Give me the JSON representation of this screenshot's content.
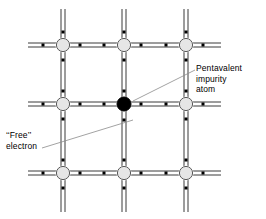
{
  "diagram": {
    "labels": {
      "pentavalent": "Pentavalent\nimpurity\natom",
      "free_electron": "‘‘Free’’\nelectron"
    },
    "colors": {
      "background": "#ffffff",
      "bond_line": "#3a3a3a",
      "atom_outline": "#4a4a4a",
      "atom_fill": "#e3e3e3",
      "impurity_fill": "#000000",
      "electron": "#000000",
      "leader_line": "#808080",
      "text": "#000000"
    },
    "geometry": {
      "columns_x": [
        63,
        124,
        186
      ],
      "rows_y": [
        45,
        104,
        173
      ],
      "atom_radius": 7,
      "impurity_radius": 7,
      "bond_gap": 4,
      "electron_size": 3,
      "h_line_start": 28,
      "h_line_end": 221,
      "v_line_start": 9,
      "v_line_end": 212
    },
    "atoms": [
      {
        "name": "atom-r0-c0",
        "col": 0,
        "row": 0,
        "type": "silicon"
      },
      {
        "name": "atom-r0-c1",
        "col": 1,
        "row": 0,
        "type": "silicon"
      },
      {
        "name": "atom-r0-c2",
        "col": 2,
        "row": 0,
        "type": "silicon"
      },
      {
        "name": "atom-r1-c0",
        "col": 0,
        "row": 1,
        "type": "silicon"
      },
      {
        "name": "atom-r1-c1",
        "col": 1,
        "row": 1,
        "type": "pentavalent-impurity"
      },
      {
        "name": "atom-r1-c2",
        "col": 2,
        "row": 1,
        "type": "silicon"
      },
      {
        "name": "atom-r2-c0",
        "col": 0,
        "row": 2,
        "type": "silicon"
      },
      {
        "name": "atom-r2-c1",
        "col": 1,
        "row": 2,
        "type": "silicon"
      },
      {
        "name": "atom-r2-c2",
        "col": 2,
        "row": 2,
        "type": "silicon"
      }
    ],
    "leaders": [
      {
        "name": "leader-pentavalent",
        "x1": 133,
        "y1": 101,
        "x2": 194,
        "y2": 70
      },
      {
        "name": "leader-free-electron",
        "x1": 133,
        "y1": 120,
        "x2": 42,
        "y2": 148
      }
    ],
    "free_electron_marker": {
      "name": "free-electron-marker",
      "x": 133,
      "y": 120
    }
  }
}
